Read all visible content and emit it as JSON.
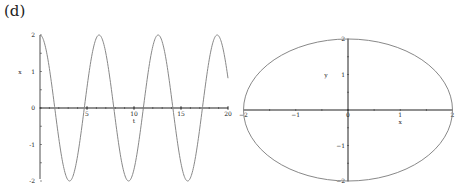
{
  "panel_label": "(d)",
  "chart_data": [
    {
      "type": "line",
      "title": "",
      "xlabel": "t",
      "ylabel": "x",
      "xlim": [
        0,
        20
      ],
      "ylim": [
        -2,
        2
      ],
      "xticks": [
        "5",
        "10",
        "15",
        "20"
      ],
      "yticks": [
        "2",
        "1",
        "0",
        "-1",
        "-2"
      ],
      "series": [
        {
          "name": "x(t)",
          "function": "2*cos(t)",
          "x_range": [
            0,
            20
          ]
        }
      ],
      "grid": false,
      "color": "#888888"
    },
    {
      "type": "line",
      "title": "",
      "xlabel": "x",
      "ylabel": "y",
      "xlim": [
        -2,
        2
      ],
      "ylim": [
        -2,
        2
      ],
      "xticks": [
        "-2",
        "-1",
        "0",
        "1",
        "2"
      ],
      "yticks": [
        "2",
        "1",
        "-1",
        "-2"
      ],
      "series": [
        {
          "name": "phase portrait",
          "function": "x^2 + y^2 = 4 (circle, radius 2)"
        }
      ],
      "grid": false,
      "color": "#888888"
    }
  ]
}
